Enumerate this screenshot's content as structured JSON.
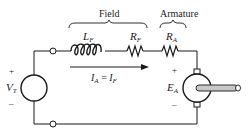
{
  "diagram": {
    "groups": {
      "field": "Field",
      "armature": "Armature"
    },
    "components": {
      "inductor": {
        "symbol": "L",
        "subscript": "F"
      },
      "field_resistor": {
        "symbol": "R",
        "subscript": "F"
      },
      "armature_resistor": {
        "symbol": "R",
        "subscript": "A"
      },
      "source": {
        "symbol": "V",
        "subscript": "T",
        "plus": "+",
        "minus": "–"
      },
      "motor_emf": {
        "symbol": "E",
        "subscript": "A",
        "plus": "+",
        "minus": "–"
      }
    },
    "current": {
      "lhs": "I",
      "lhs_sub": "A",
      "eq": " = ",
      "rhs": "I",
      "rhs_sub": "F"
    },
    "colors": {
      "line": "#1a1a1a",
      "shaft_fill": "#c8c8c8"
    }
  }
}
